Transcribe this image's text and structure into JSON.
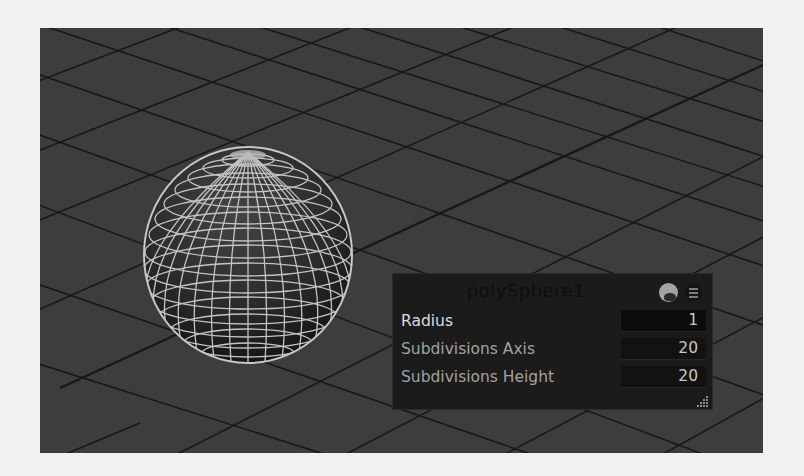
{
  "viewport": {
    "background": "#3d3d3d",
    "grid_color": "#111111",
    "object": {
      "name": "polySphere1",
      "type": "sphere-wireframe",
      "wire_color": "#c2c2c2"
    }
  },
  "panel": {
    "title": "polySphere1",
    "icons": [
      "node-editor-icon",
      "menu-icon"
    ],
    "rows": [
      {
        "label": "Radius",
        "value": "1",
        "active": true
      },
      {
        "label": "Subdivisions Axis",
        "value": "20",
        "active": false
      },
      {
        "label": "Subdivisions Height",
        "value": "20",
        "active": false
      }
    ]
  }
}
